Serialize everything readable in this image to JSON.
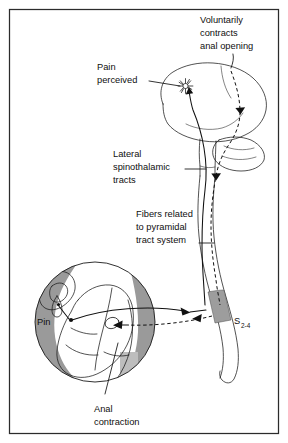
{
  "figure": {
    "background_color": "#ffffff",
    "border_color": "#2b2b2b",
    "ink_color": "#111111",
    "shade_gray": "#9a9a9a",
    "shade_gray_light": "#bdbdbd"
  },
  "labels": {
    "voluntarily_contracts": {
      "line1": "Voluntarily",
      "line2": "contracts",
      "line3": "anal opening"
    },
    "pain_perceived": {
      "line1": "Pain",
      "line2": "perceived"
    },
    "lateral_spinothalamic": {
      "line1": "Lateral",
      "line2": "spinothalamic",
      "line3": "tracts"
    },
    "fibers_pyramidal": {
      "line1": "Fibers related",
      "line2": "to pyramidal",
      "line3": "tract system"
    },
    "pin": "Pin",
    "segment": {
      "base": "S",
      "subscript": "2-4"
    },
    "anal_contraction": {
      "line1": "Anal",
      "line2": "contraction"
    }
  },
  "structures": {
    "brain": "cerebrum-cerebellum-brainstem",
    "spinal_cord": "spinal-cord",
    "sacral_segment": "sacral-segment-s2-s4",
    "buttocks_inset": "gluteal-region-circle",
    "hand_with_pin": "hand-holding-pin",
    "pain_burst": "pain-starburst-icon"
  },
  "pathways": [
    {
      "name": "afferent-sensory",
      "style": "solid",
      "direction": "pin-to-cord-to-brain",
      "description": "Lateral spinothalamic tracts carrying pain"
    },
    {
      "name": "efferent-motor",
      "style": "dashed",
      "direction": "brain-to-cord-to-anus",
      "description": "Fibers related to pyramidal tract system"
    }
  ]
}
